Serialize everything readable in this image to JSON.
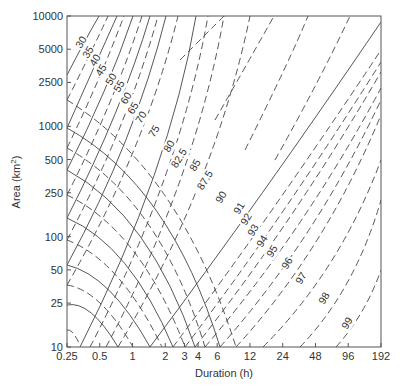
{
  "chart_data": {
    "type": "line",
    "title": "",
    "xlabel": "Duration (h)",
    "ylabel": "Area (km²)",
    "x_scale": "log",
    "y_scale": "log",
    "xlim": [
      0.25,
      192
    ],
    "ylim": [
      10,
      10000
    ],
    "x_ticks": [
      "0.25",
      "0.5",
      "1",
      "2",
      "3",
      "4",
      "6",
      "12",
      "24",
      "48",
      "96",
      "192"
    ],
    "y_ticks": [
      "10",
      "25",
      "50",
      "100",
      "250",
      "500",
      "1000",
      "2500",
      "5000",
      "10000"
    ],
    "grid": false,
    "legend": null,
    "contour_levels": [
      "30",
      "35",
      "40",
      "45",
      "50",
      "55",
      "60",
      "65",
      "70",
      "75",
      "80",
      "82.5",
      "85",
      "87.5",
      "90",
      "91",
      "92",
      "93",
      "94",
      "95",
      "96",
      "97",
      "98",
      "99"
    ],
    "series": [
      {
        "name": "unlabeled-a",
        "style": "dash",
        "path": [
          [
            67,
            330
          ],
          [
            72,
            328
          ],
          [
            80,
            345
          ]
        ]
      },
      {
        "name": "unlabeled-b",
        "style": "solid",
        "path": [
          [
            67,
            305
          ],
          [
            90,
            300
          ],
          [
            118,
            347
          ]
        ]
      },
      {
        "name": "unlabeled-c",
        "style": "dash",
        "path": [
          [
            67,
            285
          ],
          [
            100,
            290
          ],
          [
            133,
            347
          ]
        ]
      },
      {
        "name": "unlabeled-d",
        "style": "solid",
        "path": [
          [
            67,
            265
          ],
          [
            110,
            275
          ],
          [
            150,
            347
          ]
        ]
      },
      {
        "name": "unlabeled-e",
        "style": "dash",
        "path": [
          [
            67,
            240
          ],
          [
            120,
            260
          ],
          [
            162,
            347
          ]
        ]
      },
      {
        "name": "unlabeled-f",
        "style": "solid",
        "path": [
          [
            67,
            218
          ],
          [
            130,
            245
          ],
          [
            173,
            347
          ]
        ]
      },
      {
        "name": "unlabeled-g",
        "style": "dash",
        "path": [
          [
            67,
            195
          ],
          [
            140,
            230
          ],
          [
            185,
            347
          ]
        ]
      },
      {
        "name": "unlabeled-h",
        "style": "solid",
        "path": [
          [
            67,
            170
          ],
          [
            150,
            215
          ],
          [
            195,
            347
          ]
        ]
      },
      {
        "name": "unlabeled-i",
        "style": "dash",
        "path": [
          [
            67,
            148
          ],
          [
            160,
            200
          ],
          [
            205,
            347
          ]
        ]
      },
      {
        "name": "unlabeled-j",
        "style": "solid",
        "path": [
          [
            67,
            128
          ],
          [
            170,
            185
          ],
          [
            220,
            347
          ]
        ]
      },
      {
        "name": "unlabeled-k",
        "style": "dash",
        "path": [
          [
            67,
            100
          ],
          [
            180,
            170
          ],
          [
            236,
            347
          ]
        ]
      },
      {
        "name": "30",
        "style": "solid",
        "path": [
          [
            67,
            75
          ],
          [
            85,
            40
          ],
          [
            99,
            16
          ]
        ]
      },
      {
        "name": "35",
        "style": "dash",
        "path": [
          [
            67,
            100
          ],
          [
            90,
            55
          ],
          [
            108,
            16
          ]
        ]
      },
      {
        "name": "40",
        "style": "solid",
        "path": [
          [
            67,
            128
          ],
          [
            95,
            65
          ],
          [
            117,
            16
          ]
        ]
      },
      {
        "name": "45",
        "style": "dash",
        "path": [
          [
            67,
            148
          ],
          [
            100,
            80
          ],
          [
            124,
            16
          ]
        ]
      },
      {
        "name": "50",
        "style": "solid",
        "path": [
          [
            67,
            170
          ],
          [
            108,
            90
          ],
          [
            133,
            16
          ]
        ]
      },
      {
        "name": "55",
        "style": "dash",
        "path": [
          [
            67,
            195
          ],
          [
            115,
            100
          ],
          [
            142,
            16
          ]
        ]
      },
      {
        "name": "60",
        "style": "solid",
        "path": [
          [
            67,
            218
          ],
          [
            122,
            110
          ],
          [
            150,
            16
          ]
        ]
      },
      {
        "name": "65",
        "style": "dash",
        "path": [
          [
            67,
            240
          ],
          [
            128,
            125
          ],
          [
            158,
            16
          ]
        ]
      },
      {
        "name": "70",
        "style": "solid",
        "path": [
          [
            67,
            265
          ],
          [
            135,
            140
          ],
          [
            166,
            16
          ]
        ]
      },
      {
        "name": "75",
        "style": "dash",
        "path": [
          [
            67,
            285
          ],
          [
            145,
            150
          ],
          [
            178,
            16
          ]
        ]
      },
      {
        "name": "80",
        "style": "solid",
        "path": [
          [
            80,
            347
          ],
          [
            170,
            170
          ],
          [
            196,
            16
          ]
        ]
      },
      {
        "name": "82.5",
        "style": "dash",
        "path": [
          [
            90,
            347
          ],
          [
            180,
            175
          ],
          [
            208,
            16
          ]
        ]
      },
      {
        "name": "85",
        "style": "dash",
        "path": [
          [
            106,
            347
          ],
          [
            195,
            180
          ],
          [
            224,
            16
          ]
        ]
      },
      {
        "name": "87.5",
        "style": "dash",
        "path": [
          [
            118,
            347
          ],
          [
            215,
            185
          ],
          [
            250,
            16
          ]
        ]
      },
      {
        "name": "90",
        "style": "solid",
        "path": [
          [
            150,
            347
          ],
          [
            260,
            200
          ],
          [
            381,
            22
          ]
        ]
      },
      {
        "name": "91",
        "style": "dash",
        "path": [
          [
            173,
            347
          ],
          [
            275,
            210
          ],
          [
            381,
            50
          ]
        ]
      },
      {
        "name": "92",
        "style": "dash",
        "path": [
          [
            185,
            347
          ],
          [
            285,
            215
          ],
          [
            381,
            62
          ]
        ]
      },
      {
        "name": "93",
        "style": "dash",
        "path": [
          [
            195,
            347
          ],
          [
            295,
            220
          ],
          [
            381,
            72
          ]
        ]
      },
      {
        "name": "94",
        "style": "dash",
        "path": [
          [
            205,
            347
          ],
          [
            305,
            230
          ],
          [
            381,
            88
          ]
        ]
      },
      {
        "name": "95",
        "style": "dash",
        "path": [
          [
            220,
            347
          ],
          [
            315,
            240
          ],
          [
            381,
            100
          ]
        ]
      },
      {
        "name": "96",
        "style": "dash",
        "path": [
          [
            236,
            347
          ],
          [
            325,
            250
          ],
          [
            381,
            115
          ]
        ]
      },
      {
        "name": "97",
        "style": "dash",
        "path": [
          [
            263,
            347
          ],
          [
            340,
            270
          ],
          [
            381,
            160
          ]
        ]
      },
      {
        "name": "98",
        "style": "dash",
        "path": [
          [
            300,
            347
          ],
          [
            355,
            290
          ],
          [
            381,
            200
          ]
        ]
      },
      {
        "name": "99",
        "style": "dash",
        "path": [
          [
            336,
            347
          ],
          [
            365,
            315
          ],
          [
            381,
            270
          ]
        ]
      },
      {
        "name": "upper-a",
        "style": "dash",
        "path": [
          [
            180,
            60
          ],
          [
            210,
            30
          ],
          [
            224,
            16
          ]
        ]
      },
      {
        "name": "upper-b",
        "style": "dash",
        "path": [
          [
            215,
            120
          ],
          [
            255,
            50
          ],
          [
            274,
            16
          ]
        ]
      },
      {
        "name": "upper-c",
        "style": "dash",
        "path": [
          [
            245,
            150
          ],
          [
            290,
            60
          ],
          [
            308,
            16
          ]
        ]
      },
      {
        "name": "upper-d",
        "style": "dash",
        "path": [
          [
            275,
            160
          ],
          [
            320,
            80
          ],
          [
            350,
            16
          ]
        ]
      }
    ],
    "labels": [
      {
        "text": "30",
        "x": 84,
        "y": 44
      },
      {
        "text": "35",
        "x": 91,
        "y": 54
      },
      {
        "text": "40",
        "x": 98,
        "y": 62
      },
      {
        "text": "45",
        "x": 104,
        "y": 72
      },
      {
        "text": "50",
        "x": 114,
        "y": 81
      },
      {
        "text": "55",
        "x": 122,
        "y": 88
      },
      {
        "text": "60",
        "x": 129,
        "y": 100
      },
      {
        "text": "65",
        "x": 136,
        "y": 110
      },
      {
        "text": "70",
        "x": 144,
        "y": 119
      },
      {
        "text": "75",
        "x": 157,
        "y": 133
      },
      {
        "text": "80",
        "x": 172,
        "y": 148
      },
      {
        "text": "82.5",
        "x": 182,
        "y": 160
      },
      {
        "text": "85",
        "x": 198,
        "y": 167
      },
      {
        "text": "87.5",
        "x": 208,
        "y": 182
      },
      {
        "text": "90",
        "x": 224,
        "y": 199
      },
      {
        "text": "91",
        "x": 242,
        "y": 210
      },
      {
        "text": "92",
        "x": 249,
        "y": 221
      },
      {
        "text": "93",
        "x": 256,
        "y": 232
      },
      {
        "text": "94",
        "x": 265,
        "y": 243
      },
      {
        "text": "95",
        "x": 275,
        "y": 253
      },
      {
        "text": "96",
        "x": 290,
        "y": 265
      },
      {
        "text": "97",
        "x": 304,
        "y": 280
      },
      {
        "text": "98",
        "x": 327,
        "y": 300
      },
      {
        "text": "99",
        "x": 350,
        "y": 325
      }
    ]
  },
  "axes": {
    "xlabel": "Duration (h)",
    "ylabel_main": "Area (km",
    "ylabel_sup": "2",
    "ylabel_end": ")"
  }
}
